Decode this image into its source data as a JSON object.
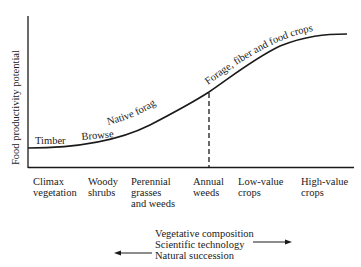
{
  "diagram": {
    "y_axis_label": "Food productivity potential",
    "curve_labels": {
      "timber": "Timber",
      "browse": "Browse",
      "native_forage": "Native forage",
      "crops": "Forage, fiber and food crops"
    },
    "x_categories": [
      {
        "line1": "Climax",
        "line2": "vegetation",
        "line3": ""
      },
      {
        "line1": "Woody",
        "line2": "shrubs",
        "line3": ""
      },
      {
        "line1": "Perennial",
        "line2": "grasses",
        "line3": "and weeds"
      },
      {
        "line1": "Annual",
        "line2": "weeds",
        "line3": ""
      },
      {
        "line1": "Low-value",
        "line2": "crops",
        "line3": ""
      },
      {
        "line1": "High-value",
        "line2": "crops",
        "line3": ""
      }
    ],
    "legend": {
      "vegetative": "Vegetative composition",
      "technology": "Scientific technology",
      "succession": "Natural succession"
    },
    "colors": {
      "ink": "#1a1a1a",
      "background": "#ffffff"
    }
  }
}
